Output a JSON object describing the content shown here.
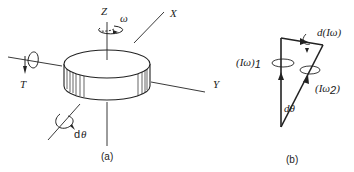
{
  "figure_a": {
    "caption": "(a)",
    "axes": {
      "z_label": "Z",
      "x_label": "X",
      "y_label": "Y"
    },
    "symbols": {
      "omega": "ω",
      "torque": "T",
      "dtheta_d": "d",
      "dtheta_theta": "θ"
    }
  },
  "figure_b": {
    "caption": "(b)",
    "labels": {
      "iw1": "(Iω)",
      "iw1_sub": "1",
      "iw2": "(Iω",
      "iw2_sub": "2",
      "iw2_close": ")",
      "d_iw": "d(Iω)",
      "dtheta": "dθ"
    }
  },
  "colors": {
    "ink": "#222222",
    "background": "#ffffff"
  }
}
